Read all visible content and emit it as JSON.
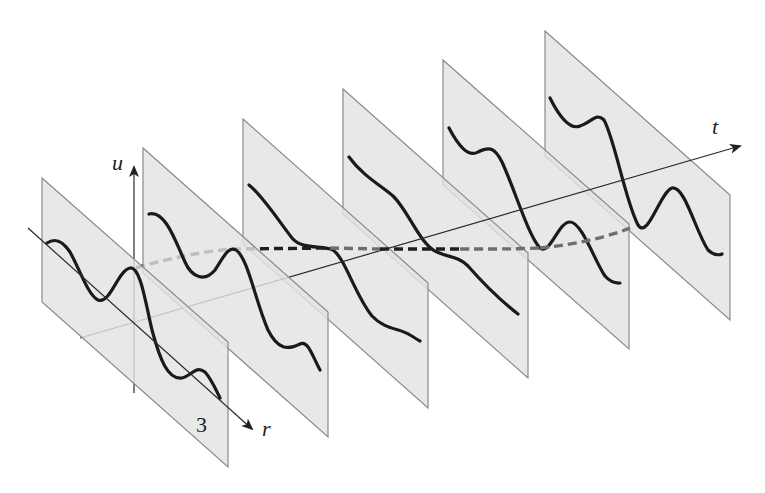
{
  "figure": {
    "axes": {
      "u_label": "u",
      "t_label": "t",
      "r_label": "r"
    },
    "panel_label": "3",
    "panel_count": 6,
    "colors": {
      "panel_fill": "#e3e3e3",
      "panel_stroke": "#8a8a8a",
      "curve": "#1a1a1a",
      "dashed_front": "#1e1e1e",
      "dashed_back": "#6e6e6e"
    }
  }
}
